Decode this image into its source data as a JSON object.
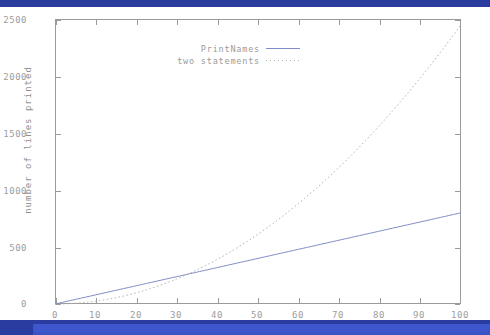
{
  "chart_data": {
    "type": "line",
    "title": "",
    "xlabel": "number of statements",
    "ylabel": "number of lines printed",
    "xlim": [
      0,
      100
    ],
    "ylim": [
      0,
      2500
    ],
    "xticks": [
      0,
      10,
      20,
      30,
      40,
      50,
      60,
      70,
      80,
      90,
      100
    ],
    "yticks": [
      0,
      500,
      1000,
      1500,
      2000,
      2500
    ],
    "grid": false,
    "legend_position": "top-center",
    "series": [
      {
        "name": "PrintNames",
        "style": "solid",
        "color": "#7f8cc7",
        "x": [
          0,
          10,
          20,
          30,
          40,
          50,
          60,
          70,
          80,
          90,
          100
        ],
        "values": [
          0,
          80,
          160,
          240,
          320,
          400,
          480,
          560,
          640,
          720,
          800
        ]
      },
      {
        "name": "two statements",
        "style": "dotted",
        "color": "#b0b0b0",
        "x": [
          0,
          10,
          20,
          30,
          40,
          50,
          60,
          70,
          80,
          90,
          100
        ],
        "values": [
          0,
          25,
          98,
          221,
          392,
          613,
          882,
          1201,
          1568,
          1985,
          2450
        ]
      }
    ]
  },
  "axes": {
    "y_title": "number of lines printed",
    "x_title": "number of statements",
    "y_tick_labels": [
      "2500",
      "2000",
      "1500",
      "1000",
      "500",
      "0"
    ],
    "x_tick_labels": [
      "0",
      "10",
      "20",
      "30",
      "40",
      "50",
      "60",
      "70",
      "80",
      "90",
      "100"
    ]
  },
  "legend": {
    "entries": [
      {
        "label": "PrintNames",
        "style": "solid"
      },
      {
        "label": "two statements",
        "style": "dotted"
      }
    ]
  },
  "colors": {
    "band": "#2a3b9e",
    "band_light": "#3f57cc",
    "series_solid": "#7f8cc7",
    "series_dotted": "#b0b0b0",
    "axis": "#9a9a9a",
    "tick_text": "#9d9d9d"
  }
}
